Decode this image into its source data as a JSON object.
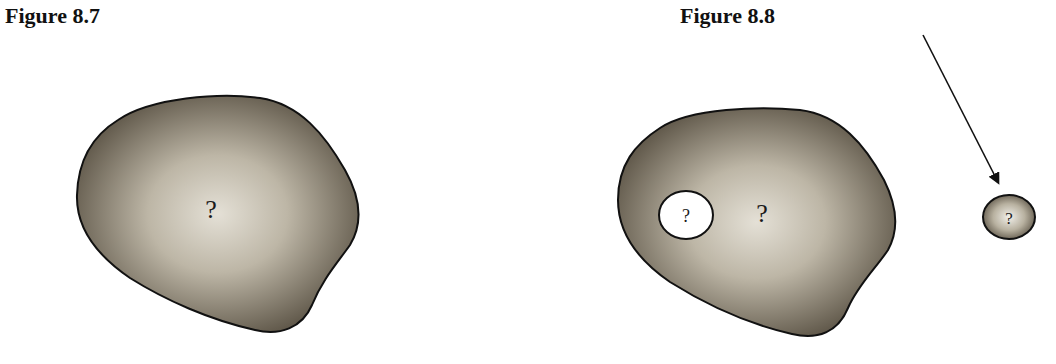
{
  "figures": [
    {
      "title": "Figure 8.7",
      "blob_label": "?",
      "description": "irregular shaded region with unknown contents"
    },
    {
      "title": "Figure 8.8",
      "blob_label": "?",
      "hole_label": "?",
      "fragment_label": "?",
      "description": "irregular shaded region with a white hole; an arrow points to a small separated shaded fragment"
    }
  ],
  "colors": {
    "blob_edge": "#5e5648",
    "blob_center": "#e4e0d6",
    "outline": "#111111",
    "hole_fill": "#ffffff"
  }
}
